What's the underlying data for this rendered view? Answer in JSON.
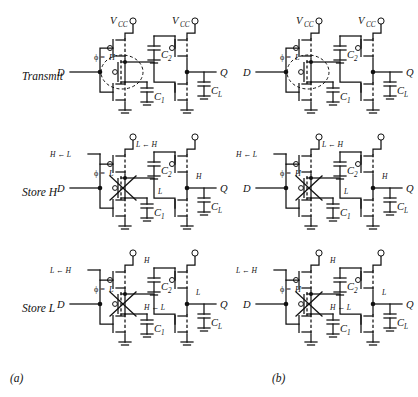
{
  "figure": {
    "captions": [
      {
        "key": "a",
        "label": "(a)"
      },
      {
        "key": "b",
        "label": "(b)"
      }
    ],
    "row_labels": [
      "Transmit",
      "Store H",
      "Store L"
    ],
    "common": {
      "vcc": "V",
      "vcc_sub": "CC",
      "input_label": "D",
      "output_label": "Q",
      "cap1": "C",
      "cap1_sub": "1",
      "cap2": "C",
      "cap2_sub": "2",
      "capl": "C",
      "capl_sub": "L",
      "phi_symbol": "ϕ =",
      "arrow": "←"
    },
    "colors": {
      "line": "#111111",
      "background": "#ffffff",
      "text": "#111111"
    },
    "cells": [
      {
        "id": "a-transmit",
        "column": "a",
        "row": "Transmit",
        "show_vcc_text": true,
        "gate_state": "open",
        "phi_value": "H",
        "highlight": "dashed-ellipse",
        "labels": {
          "pmos_left_gate": "",
          "inv1_out": "",
          "nmos_left_gate": "",
          "output_node": ""
        }
      },
      {
        "id": "a-storeh",
        "column": "a",
        "row": "Store H",
        "show_vcc_text": false,
        "gate_state": "closed",
        "phi_value": "L",
        "highlight": "cross",
        "labels": {
          "pmos_left_gate": "H ← L",
          "inv1_out": "L ← H",
          "nmos_left_gate": "L",
          "output_node": "H"
        }
      },
      {
        "id": "a-storel",
        "column": "a",
        "row": "Store L",
        "show_vcc_text": false,
        "gate_state": "closed",
        "phi_value": "L",
        "highlight": "cross",
        "labels": {
          "pmos_left_gate": "L ← H",
          "inv1_out": "H",
          "nmos_left_gate": "H ← L",
          "output_node": "L"
        }
      },
      {
        "id": "b-transmit",
        "column": "b",
        "row": "Transmit",
        "show_vcc_text": true,
        "gate_state": "open",
        "phi_value": "L",
        "highlight": "dashed-ellipse",
        "labels": {
          "pmos_left_gate": "",
          "inv1_out": "",
          "nmos_left_gate": "",
          "output_node": ""
        }
      },
      {
        "id": "b-storeh",
        "column": "b",
        "row": "Store H",
        "show_vcc_text": false,
        "gate_state": "closed",
        "phi_value": "H",
        "highlight": "cross",
        "labels": {
          "pmos_left_gate": "H ← L",
          "inv1_out": "L ← H",
          "nmos_left_gate": "L",
          "output_node": "H"
        }
      },
      {
        "id": "b-storel",
        "column": "b",
        "row": "Store L",
        "show_vcc_text": false,
        "gate_state": "closed",
        "phi_value": "H",
        "highlight": "cross",
        "labels": {
          "pmos_left_gate": "L ← H",
          "inv1_out": "H",
          "nmos_left_gate": "H ← L",
          "output_node": "L"
        }
      }
    ]
  }
}
